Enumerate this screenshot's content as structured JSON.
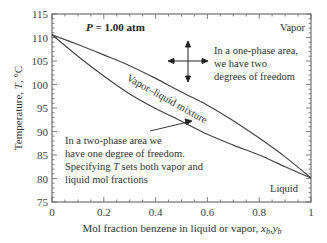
{
  "chart_data": {
    "type": "line",
    "title": "P = 1.00 atm",
    "title_italic_part": "P",
    "title_rest": " = 1.00 atm",
    "xlabel": "Mol fraction benzene in liquid or vapor, x_b,y_b",
    "xlabel_text": "Mol fraction benzene in liquid or vapor, ",
    "xlabel_vars": "x",
    "xlabel_sub1": "b",
    "xlabel_sep": ",",
    "xlabel_var2": "y",
    "xlabel_sub2": "b",
    "ylabel": "Temperature, T, °C",
    "ylabel_pre": "Temperature, ",
    "ylabel_var": "T",
    "ylabel_post": ", °C",
    "xlim": [
      0,
      1
    ],
    "ylim": [
      75,
      115
    ],
    "x_ticks": [
      "0",
      "0.2",
      "0.4",
      "0.6",
      "0.8",
      "1"
    ],
    "y_ticks": [
      "75",
      "80",
      "85",
      "90",
      "95",
      "100",
      "105",
      "110",
      "115"
    ],
    "grid": false,
    "legend": null,
    "x": [
      0,
      0.1,
      0.2,
      0.3,
      0.4,
      0.5,
      0.6,
      0.7,
      0.8,
      0.9,
      1.0
    ],
    "series": [
      {
        "name": "Dew point (vapor) curve",
        "values": [
          110.6,
          108.5,
          106.3,
          104.0,
          101.3,
          98.4,
          95.6,
          92.3,
          88.6,
          84.6,
          80.1
        ]
      },
      {
        "name": "Bubble point (liquid) curve",
        "values": [
          110.6,
          106.0,
          101.8,
          98.0,
          94.9,
          92.2,
          89.4,
          87.1,
          85.0,
          82.5,
          80.1
        ]
      }
    ],
    "region_labels": {
      "vapor": "Vapor",
      "liquid": "Liquid",
      "mixture": "Vapor–liquid mixture"
    },
    "annotations": {
      "one_phase": [
        "In a one-phase area,",
        "we have two",
        "degrees of freedom"
      ],
      "two_phase": [
        "In a two-phase area we",
        "have one degree of freedom.",
        "Specifying ",
        "T",
        " sets both vapor and",
        "liquid mol fractions"
      ]
    }
  },
  "colors": {
    "line": "#444444",
    "axis": "#555555",
    "text": "#333333",
    "background": "#ffffff"
  }
}
